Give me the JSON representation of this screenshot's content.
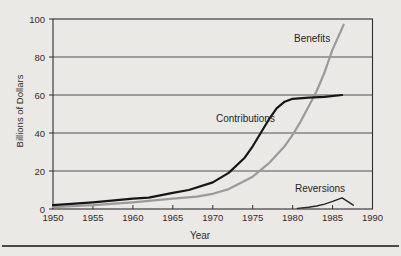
{
  "chart_data": {
    "type": "line",
    "title": "",
    "xlabel": "Year",
    "ylabel": "Billions of Dollars",
    "xlim": [
      1950,
      1990
    ],
    "ylim": [
      0,
      100
    ],
    "x_ticks": [
      1950,
      1955,
      1960,
      1965,
      1970,
      1975,
      1980,
      1985,
      1990
    ],
    "y_ticks": [
      0,
      20,
      40,
      60,
      80,
      100
    ],
    "grid": "horizontal",
    "legend_position": "inline-labels",
    "frame_color": "#2f2f2f",
    "gridline_color": "#3f3f3f",
    "background_color": "#ebe9e5",
    "series": [
      {
        "name": "Benefits",
        "color": "#9a9a9a",
        "width": 2.2,
        "points": [
          [
            1950,
            1
          ],
          [
            1955,
            2
          ],
          [
            1960,
            3.5
          ],
          [
            1965,
            5.5
          ],
          [
            1968,
            6.5
          ],
          [
            1970,
            8
          ],
          [
            1972,
            10.5
          ],
          [
            1975,
            17
          ],
          [
            1977,
            24
          ],
          [
            1979,
            33
          ],
          [
            1980,
            39
          ],
          [
            1981,
            46
          ],
          [
            1982,
            54
          ],
          [
            1983,
            62
          ],
          [
            1984,
            72
          ],
          [
            1985,
            84
          ],
          [
            1986.4,
            97
          ]
        ]
      },
      {
        "name": "Contributions",
        "color": "#161616",
        "width": 2.2,
        "points": [
          [
            1950,
            2
          ],
          [
            1955,
            3.5
          ],
          [
            1960,
            5.5
          ],
          [
            1962,
            6
          ],
          [
            1965,
            8.5
          ],
          [
            1967,
            10
          ],
          [
            1970,
            14
          ],
          [
            1972,
            19
          ],
          [
            1974,
            27
          ],
          [
            1975,
            33
          ],
          [
            1976,
            40
          ],
          [
            1977,
            47
          ],
          [
            1978,
            53
          ],
          [
            1979,
            56.5
          ],
          [
            1980,
            58
          ],
          [
            1982,
            58.6
          ],
          [
            1984,
            59
          ],
          [
            1986.2,
            60
          ]
        ]
      },
      {
        "name": "Reversions",
        "color": "#262626",
        "width": 1.4,
        "points": [
          [
            1980.6,
            0.3
          ],
          [
            1982,
            0.9
          ],
          [
            1983,
            1.6
          ],
          [
            1984,
            2.6
          ],
          [
            1985,
            4
          ],
          [
            1986.2,
            5.9
          ],
          [
            1987.6,
            2
          ]
        ]
      }
    ]
  }
}
